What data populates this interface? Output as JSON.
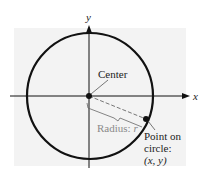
{
  "diagram": {
    "type": "circle-standard-form",
    "axes": {
      "x_label": "x",
      "y_label": "y"
    },
    "labels": {
      "center": "Center",
      "radius_prefix": "Radius: ",
      "radius_var": "r",
      "point_line1": "Point on",
      "point_line2": "circle:",
      "point_coords": "(x,  y)"
    },
    "colors": {
      "background_panel": "#f2f2f2",
      "stroke": "#111111",
      "radius_label": "#8a8a8a"
    }
  }
}
